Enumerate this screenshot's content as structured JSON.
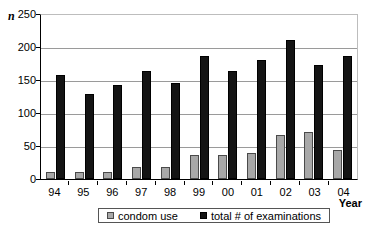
{
  "chart_data": {
    "type": "bar",
    "title": "",
    "xlabel": "Year",
    "ylabel": "n",
    "ylim": [
      0,
      250
    ],
    "yticks": [
      0,
      50,
      100,
      150,
      200,
      250
    ],
    "grid": true,
    "legend_position": "bottom",
    "categories": [
      "94",
      "95",
      "96",
      "97",
      "98",
      "99",
      "00",
      "01",
      "02",
      "03",
      "04"
    ],
    "series": [
      {
        "name": "condom use",
        "color": "#a8a8a8",
        "values": [
          10,
          10,
          11,
          18,
          19,
          37,
          37,
          40,
          67,
          71,
          44
        ]
      },
      {
        "name": "total # of examinations",
        "color": "#141414",
        "values": [
          158,
          130,
          144,
          165,
          146,
          188,
          165,
          181,
          212,
          174,
          188
        ]
      }
    ]
  }
}
